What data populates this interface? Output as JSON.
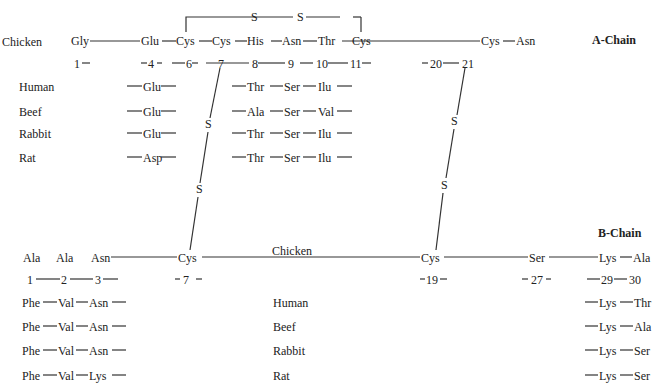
{
  "title_a": "A-Chain",
  "title_b": "B-Chain",
  "a_chain": {
    "species_label": "Chicken",
    "residues": [
      "Gly",
      "Glu",
      "Cys",
      "Cys",
      "His",
      "Asn",
      "Thr",
      "Cys",
      "Cys",
      "Asn"
    ],
    "positions": [
      "1",
      "4",
      "6",
      "7",
      "8",
      "9",
      "10",
      "11",
      "20",
      "21"
    ],
    "disulfide_top": [
      "S",
      "S"
    ],
    "variants": [
      {
        "species": "Human",
        "pos4": "Glu",
        "pos8": "Thr",
        "pos9": "Ser",
        "pos10": "Ilu"
      },
      {
        "species": "Beef",
        "pos4": "Glu",
        "pos8": "Ala",
        "pos9": "Ser",
        "pos10": "Val"
      },
      {
        "species": "Rabbit",
        "pos4": "Glu",
        "pos8": "Thr",
        "pos9": "Ser",
        "pos10": "Ilu"
      },
      {
        "species": "Rat",
        "pos4": "Asp",
        "pos8": "Thr",
        "pos9": "Ser",
        "pos10": "Ilu"
      }
    ]
  },
  "interchain_links": {
    "left": [
      "S",
      "S"
    ],
    "right": [
      "S",
      "S"
    ]
  },
  "b_chain": {
    "species_label": "Chicken",
    "residues": [
      "Ala",
      "Ala",
      "Asn",
      "Cys",
      "Cys",
      "Ser",
      "Lys",
      "Ala"
    ],
    "positions": [
      "1",
      "2",
      "3",
      "7",
      "19",
      "27",
      "29",
      "30"
    ],
    "variants": [
      {
        "species": "Human",
        "p1": "Phe",
        "p2": "Val",
        "p3": "Asn",
        "p29": "Lys",
        "p30": "Thr"
      },
      {
        "species": "Beef",
        "p1": "Phe",
        "p2": "Val",
        "p3": "Asn",
        "p29": "Lys",
        "p30": "Ala"
      },
      {
        "species": "Rabbit",
        "p1": "Phe",
        "p2": "Val",
        "p3": "Asn",
        "p29": "Lys",
        "p30": "Ser"
      },
      {
        "species": "Rat",
        "p1": "Phe",
        "p2": "Val",
        "p3": "Lys",
        "p29": "Lys",
        "p30": "Ser"
      }
    ]
  }
}
